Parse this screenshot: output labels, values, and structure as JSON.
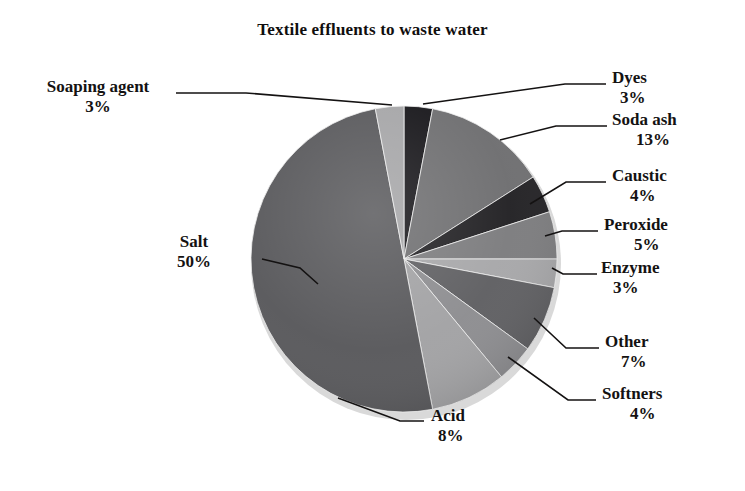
{
  "chart_data": {
    "type": "pie",
    "title": "Textile effluents to waste water",
    "xlabel": "",
    "ylabel": "",
    "legend_position": "none",
    "grid": false,
    "labels_show_percent": true,
    "start_angle_deg": 0,
    "direction": "clockwise",
    "categories": [
      "Dyes",
      "Soda ash",
      "Caustic",
      "Peroxide",
      "Enzyme",
      "Other",
      "Softners",
      "Acid",
      "Salt",
      "Soaping agent"
    ],
    "values": [
      3,
      13,
      4,
      5,
      3,
      7,
      4,
      8,
      50,
      3
    ],
    "units": "%",
    "total": 100,
    "slices": [
      {
        "name": "Dyes",
        "value": 3,
        "percent_text": "3%",
        "color": "#17161a"
      },
      {
        "name": "Soda ash",
        "value": 13,
        "percent_text": "13%",
        "color": "#6e6e70"
      },
      {
        "name": "Caustic",
        "value": 4,
        "percent_text": "4%",
        "color": "#222124"
      },
      {
        "name": "Peroxide",
        "value": 5,
        "percent_text": "5%",
        "color": "#7c7c7e"
      },
      {
        "name": "Enzyme",
        "value": 3,
        "percent_text": "3%",
        "color": "#a7a7a9"
      },
      {
        "name": "Other",
        "value": 7,
        "percent_text": "7%",
        "color": "#5f5f62"
      },
      {
        "name": "Softners",
        "value": 4,
        "percent_text": "4%",
        "color": "#8d8d90"
      },
      {
        "name": "Acid",
        "value": 8,
        "percent_text": "8%",
        "color": "#a2a2a4"
      },
      {
        "name": "Salt",
        "value": 50,
        "percent_text": "50%",
        "color": "#58585b"
      },
      {
        "name": "Soaping agent",
        "value": 3,
        "percent_text": "3%",
        "color": "#a5a5a7"
      }
    ]
  },
  "labels": {
    "soaping_agent": {
      "name": "Soaping agent",
      "percent": "3%"
    },
    "dyes": {
      "name": "Dyes",
      "percent": "3%"
    },
    "soda_ash": {
      "name": "Soda ash",
      "percent": "13%"
    },
    "caustic": {
      "name": "Caustic",
      "percent": "4%"
    },
    "peroxide": {
      "name": "Peroxide",
      "percent": "5%"
    },
    "enzyme": {
      "name": "Enzyme",
      "percent": "3%"
    },
    "other": {
      "name": "Other",
      "percent": "7%"
    },
    "softners": {
      "name": "Softners",
      "percent": "4%"
    },
    "acid": {
      "name": "Acid",
      "percent": "8%"
    },
    "salt": {
      "name": "Salt",
      "percent": "50%"
    }
  },
  "style": {
    "background": "#ffffff",
    "text_color": "#141212",
    "leader_line_color": "#141212"
  }
}
